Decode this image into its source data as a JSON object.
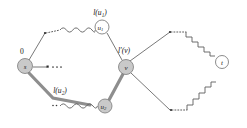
{
  "figure": {
    "type": "graph-diagram",
    "width": 247,
    "height": 128,
    "background": "#ffffff"
  },
  "colors": {
    "node_fill": "#c9c9c9",
    "node_stroke": "#7a7a7a",
    "edge_thin": "#6a6a6a",
    "edge_thick": "#8e8e8e",
    "text": "#141414"
  },
  "nodes": [
    {
      "id": "s",
      "label": "s",
      "sub": "",
      "x": 25,
      "y": 66,
      "r": 7.5,
      "style": "filled"
    },
    {
      "id": "u1",
      "label": "u",
      "sub": "1",
      "x": 102,
      "y": 27,
      "r": 7.0,
      "style": "open"
    },
    {
      "id": "u2",
      "label": "u",
      "sub": "2",
      "x": 105,
      "y": 106,
      "r": 7.0,
      "style": "filled"
    },
    {
      "id": "v",
      "label": "v",
      "sub": "",
      "x": 126,
      "y": 67,
      "r": 7.5,
      "style": "filled"
    },
    {
      "id": "t",
      "label": "t",
      "sub": "",
      "x": 222,
      "y": 62,
      "r": 6.5,
      "style": "open"
    }
  ],
  "labels": [
    {
      "id": "weight-zero",
      "text": "0",
      "base": "0",
      "sub": "",
      "x": 22,
      "y": 51,
      "kind": "weight"
    },
    {
      "id": "label-u1",
      "text": "l(u1)",
      "base": "l(u",
      "sub": "1",
      "tail": ")",
      "x": 100,
      "y": 12,
      "kind": "edge-label"
    },
    {
      "id": "label-u2",
      "text": "l(u2)",
      "base": "l(u",
      "sub": "2",
      "tail": ")",
      "x": 60,
      "y": 90,
      "kind": "edge-label"
    },
    {
      "id": "label-v",
      "text": "l'(v)",
      "base": "l'(v)",
      "sub": "",
      "tail": "",
      "x": 124,
      "y": 50,
      "kind": "edge-label"
    }
  ],
  "edges": [
    {
      "id": "s-to-upper-branch",
      "from": "s",
      "to": "branch-upper",
      "style": "thin"
    },
    {
      "id": "s-to-u2",
      "from": "s",
      "to": "u2",
      "style": "thick"
    },
    {
      "id": "s-ellipsis",
      "from": "s",
      "to": "ellipsis",
      "style": "thin-stub"
    },
    {
      "id": "upper-dotted",
      "from": "branch-upper",
      "to": "wave-upper",
      "style": "dotted"
    },
    {
      "id": "upper-wavy-to-u1",
      "from": "wave-upper",
      "to": "u1",
      "style": "wavy"
    },
    {
      "id": "lower-wavy-to-u2",
      "from": "u2-left",
      "to": "u2",
      "style": "wavy"
    },
    {
      "id": "u1-to-v",
      "from": "u1",
      "to": "v",
      "style": "thin"
    },
    {
      "id": "u2-to-v",
      "from": "u2",
      "to": "v",
      "style": "thick"
    },
    {
      "id": "v-to-upper-right",
      "from": "v",
      "to": "branch-ur",
      "style": "thin"
    },
    {
      "id": "v-to-lower-right",
      "from": "v",
      "to": "branch-lr",
      "style": "thin"
    },
    {
      "id": "ur-dotted",
      "from": "branch-ur",
      "to": "zig-ur",
      "style": "dotted"
    },
    {
      "id": "lr-dotted",
      "from": "branch-lr",
      "to": "zig-lr",
      "style": "dotted"
    },
    {
      "id": "zigzag-upper-to-t",
      "from": "zig-ur",
      "to": "t",
      "style": "zigzag"
    },
    {
      "id": "zigzag-lower-to-t",
      "from": "zig-lr",
      "to": "t",
      "style": "zigzag"
    }
  ],
  "decorations": [
    {
      "id": "ellipsis-after-s",
      "kind": "dots",
      "count": 3,
      "x": 52,
      "y": 67
    },
    {
      "id": "junction-dot-upper-left",
      "kind": "dot",
      "x": 45,
      "y": 33
    },
    {
      "id": "junction-dot-upper-right",
      "kind": "dot",
      "x": 170,
      "y": 32
    },
    {
      "id": "junction-dot-lower-right",
      "kind": "dot",
      "x": 171,
      "y": 110
    }
  ]
}
